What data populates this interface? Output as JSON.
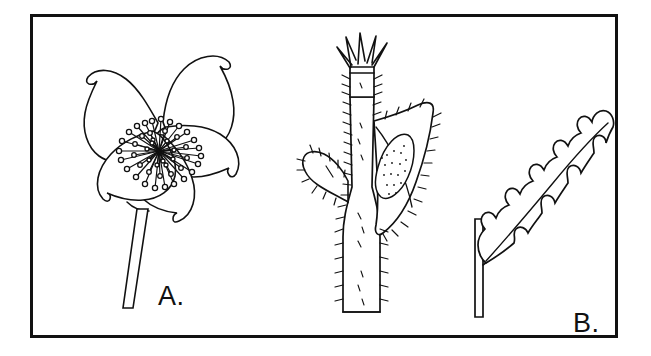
{
  "figure": {
    "kind": "botanical-line-drawing",
    "background_color": "#ffffff",
    "ink_color": "#111111",
    "frame": {
      "style": "solid rectangular border",
      "border_width_px": 3,
      "color": "#111111"
    },
    "panels": [
      {
        "id": "a",
        "label": "A.",
        "subject": "flower",
        "description": "Five-petaled open flower in face view with a dense cluster of stamens at the center and a long straight pedicel descending to the lower left.",
        "parts": [
          "petal",
          "stamen",
          "anther",
          "receptacle",
          "pedicel"
        ],
        "petal_count": 5,
        "stamen_count": 46
      },
      {
        "id": "b",
        "label": "B.",
        "subject": "hairy stem with leaves and bud",
        "description": "Upright bristly stem bearing a small leaf on the left, a larger stippled leaf on the right, and a pointed calyx bud with spreading sepal tips at the apex.",
        "parts": [
          "stem",
          "bristle-hairs",
          "lower-leaf",
          "upper-leaf",
          "bud",
          "sepal-tip"
        ],
        "sepal_tip_count": 5
      },
      {
        "id": "c",
        "label": "C.",
        "subject": "pinnatifid leaf",
        "description": "Deeply lobed lance-shaped leaf with sinuous toothed margins and a central midrib, attached by a short petiole to a straight vertical stem.",
        "parts": [
          "stem",
          "petiole",
          "midrib",
          "lobe",
          "leaf-blade"
        ],
        "lobe_count": 9
      }
    ]
  }
}
